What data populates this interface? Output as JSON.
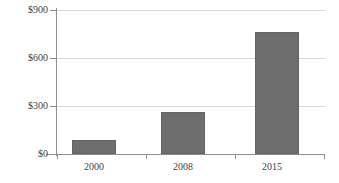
{
  "chart_data": {
    "type": "bar",
    "title": "",
    "xlabel": "",
    "ylabel": "",
    "categories": [
      "2000",
      "2008",
      "2015"
    ],
    "values": [
      90,
      265,
      760
    ],
    "ylim": [
      0,
      900
    ],
    "ytick_values": [
      0,
      300,
      600,
      900
    ],
    "ytick_labels": [
      "$0",
      "$300",
      "$600",
      "$900"
    ],
    "grid": true,
    "legend": null,
    "series": [
      {
        "name": "",
        "values": [
          90,
          265,
          760
        ]
      }
    ],
    "bar_color": "#6e6e6e",
    "gridline_color": "#d7d7d7",
    "axis_color": "#8f8f8f"
  }
}
